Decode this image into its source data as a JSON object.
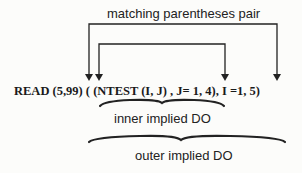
{
  "diagram": {
    "code_statement": "READ (5,99) ( (NTEST (I, J) , J= 1, 4), I =1, 5)",
    "annotations": {
      "top_label": "matching parentheses pair",
      "inner_label": "inner implied DO",
      "outer_label": "outer implied DO"
    },
    "arrows": [
      {
        "name": "outer-parentheses-pair",
        "from": "first ( after READ (5,99)",
        "to": "final )"
      },
      {
        "name": "inner-parentheses-pair",
        "from": "( before NTEST",
        "to": ") after 1, 4"
      }
    ],
    "braces": [
      {
        "name": "inner-implied-do-brace",
        "spans": "(NTEST (I, J) , J= 1, 4)"
      },
      {
        "name": "outer-implied-do-brace",
        "spans": "( (NTEST (I, J) , J= 1, 4), I =1, 5)"
      }
    ],
    "colors": {
      "ink": "#222222",
      "background": "#fcfcfa"
    }
  }
}
